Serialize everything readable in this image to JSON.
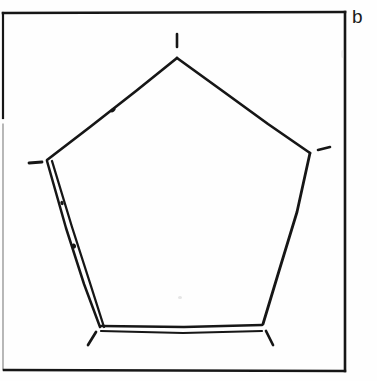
{
  "figure": {
    "panel_label": "b",
    "caption_position": "top-right-outside-frame",
    "background_color": "#fefefe",
    "ink_color": "#161616",
    "frame": {
      "name": "border-rectangle",
      "x": 3,
      "y": 12,
      "width": 342,
      "height": 359,
      "stroke_width": 2.4
    },
    "pentagon": {
      "name": "pentagon-outline",
      "stroke_width": 2.6,
      "vertices": [
        {
          "id": "apex",
          "label": "top",
          "x": 177,
          "y": 58
        },
        {
          "id": "right",
          "label": "upper-right",
          "x": 310,
          "y": 153
        },
        {
          "id": "bottom-right",
          "label": "lower-right",
          "x": 262,
          "y": 325
        },
        {
          "id": "bottom-left",
          "label": "lower-left",
          "x": 100,
          "y": 326
        },
        {
          "id": "left",
          "label": "upper-left",
          "x": 47,
          "y": 160
        }
      ],
      "edges": [
        {
          "id": "edge-apex-right",
          "from": "apex",
          "to": "right",
          "style": "single"
        },
        {
          "id": "edge-right-bottomright",
          "from": "right",
          "to": "bottom-right",
          "style": "single"
        },
        {
          "id": "edge-bottomright-bottomleft",
          "from": "bottom-right",
          "to": "bottom-left",
          "style": "double"
        },
        {
          "id": "edge-bottomleft-left",
          "from": "bottom-left",
          "to": "left",
          "style": "double"
        },
        {
          "id": "edge-left-apex",
          "from": "left",
          "to": "apex",
          "style": "single"
        }
      ],
      "tick_marks": [
        {
          "id": "tick-apex",
          "at_vertex": "apex",
          "direction": "up",
          "x1": 177,
          "y1": 34,
          "x2": 177,
          "y2": 47
        },
        {
          "id": "tick-right",
          "at_vertex": "right",
          "direction": "right",
          "x1": 317,
          "y1": 150,
          "x2": 330,
          "y2": 148
        },
        {
          "id": "tick-left",
          "at_vertex": "left",
          "direction": "left",
          "x1": 29,
          "y1": 163,
          "x2": 42,
          "y2": 162
        },
        {
          "id": "tick-bottom-left",
          "at_vertex": "bottom-left",
          "direction": "down-left",
          "x1": 95,
          "y1": 331,
          "x2": 88,
          "y2": 344
        },
        {
          "id": "tick-bottom-right",
          "at_vertex": "bottom-right",
          "direction": "down-right",
          "x1": 266,
          "y1": 331,
          "x2": 272,
          "y2": 344
        }
      ],
      "midpoint_marks": [
        {
          "id": "mark-left-edge-upper",
          "on_edge": "edge-left-apex",
          "x": 113,
          "y": 110
        },
        {
          "id": "mark-left-lower-edge",
          "on_edge": "edge-bottomleft-left",
          "x": 74,
          "y": 245
        }
      ]
    }
  }
}
